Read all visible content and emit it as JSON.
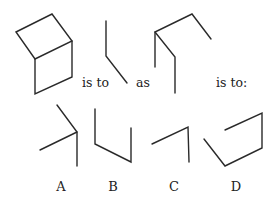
{
  "colors": {
    "stroke": "#2a2a2a",
    "text": "#222222",
    "background": "#ffffff"
  },
  "question": {
    "phrase_1": "is to",
    "phrase_2": "as",
    "phrase_3": "is to:"
  },
  "figures": {
    "source": "open cube with top face",
    "source_result": "bent line",
    "target": "branched line figure"
  },
  "options": [
    {
      "label": "A"
    },
    {
      "label": "B"
    },
    {
      "label": "C"
    },
    {
      "label": "D"
    }
  ]
}
